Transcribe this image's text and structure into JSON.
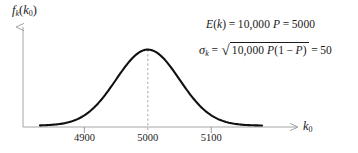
{
  "figure": {
    "title": "",
    "axes": {
      "y_label": {
        "base": "f",
        "base_sub": "k",
        "arg_open": "(",
        "arg": "k",
        "arg_sub": "0",
        "arg_close": ")",
        "full_text": "f_k(k_0)"
      },
      "x_label": {
        "base": "k",
        "sub": "0",
        "full_text": "k_0"
      },
      "x_ticks": [
        "4900",
        "5000",
        "5100"
      ],
      "x_tick_values": [
        4900,
        5000,
        5100
      ],
      "y_ticks": []
    },
    "annotations": {
      "mean_equation": {
        "lhs_fn": "E",
        "lhs_open": "(",
        "lhs_var": "k",
        "lhs_close": ")",
        "eq1": "=",
        "coefficient": "10,000",
        "variable": "P",
        "eq2": "=",
        "result": "5000",
        "full_text": "E(k) = 10,000 P = 5000"
      },
      "sigma_equation": {
        "lhs_sym": "σ",
        "lhs_sub": "k",
        "eq1": "=",
        "surd": "√",
        "radicand_coefficient": "10,000",
        "radicand_p": "P",
        "radicand_open": "(",
        "radicand_one": "1",
        "radicand_minus": "−",
        "radicand_p2": "P",
        "radicand_close": ")",
        "eq2": "=",
        "result": "50",
        "full_text": "σ_k = √(10,000 P(1−P)) = 50"
      }
    },
    "colors": {
      "curve": "#111111",
      "axis": "#9a9a9a",
      "dashed_line": "#9a9a9a",
      "tick": "#8e8e8e",
      "text": "#1b1b1b",
      "background": "#ffffff"
    }
  },
  "chart_data": {
    "type": "line",
    "title": "",
    "subtitle": "",
    "xlabel": "k_0",
    "ylabel": "f_k(k_0)",
    "distribution": "normal",
    "mean": 5000,
    "std_dev": 50,
    "n": 10000,
    "p_label": "P",
    "xlim": [
      4830,
      5180
    ],
    "ylim": [
      0,
      1.12
    ],
    "grid": false,
    "legend": "none",
    "tick_labels": [
      "4900",
      "5000",
      "5100"
    ],
    "tick_values": [
      4900,
      5000,
      5100
    ],
    "annotations": [
      "E(k) = 10,000 P = 5000",
      "σ_k = √(10,000 P(1−P)) = 50"
    ],
    "vertical_dashed_line_at": 5000,
    "x": [
      4850,
      4875,
      4900,
      4925,
      4950,
      4975,
      5000,
      5025,
      5050,
      5075,
      5100,
      5125,
      5150
    ],
    "y": [
      0.001,
      0.007,
      0.044,
      0.165,
      0.472,
      0.882,
      1.0,
      0.882,
      0.472,
      0.165,
      0.044,
      0.007,
      0.001
    ],
    "series": [
      {
        "name": "f_k(k_0)",
        "values": [
          0.001,
          0.007,
          0.044,
          0.165,
          0.472,
          0.882,
          1.0,
          0.882,
          0.472,
          0.165,
          0.044,
          0.007,
          0.001
        ]
      }
    ]
  }
}
